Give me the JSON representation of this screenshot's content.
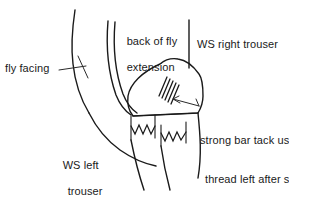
{
  "diagram": {
    "style": "hand-drawn line illustration",
    "ink_color": "#1a1a1a",
    "background_color": "#ffffff"
  },
  "labels": {
    "fly_facing": "fly facing",
    "back_of_fly_line1": "back of fly",
    "back_of_fly_line2": "extension",
    "ws_right_trouser": "WS right trouser",
    "ws_left_trouser_line1": "WS left",
    "ws_left_trouser_line2": "trouser",
    "bar_tack_line1": "strong bar tack us",
    "bar_tack_line2": "thread left after s",
    "bar_tack_line3": "stitched triangle"
  },
  "features": {
    "bar_tack_stitch_count": 5,
    "zigzag_edge_count": 2,
    "zigzag_teeth_left": 4,
    "zigzag_teeth_right": 4
  }
}
